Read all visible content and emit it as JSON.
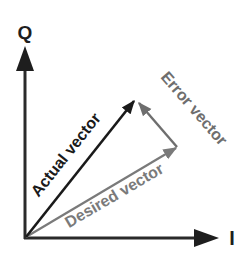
{
  "diagram": {
    "axes": {
      "q_label": "Q",
      "i_label": "I"
    },
    "vectors": {
      "actual": {
        "label": "Actual vector",
        "color": "#1a1a1a"
      },
      "desired": {
        "label": "Desired vector",
        "color": "#7a7a7a"
      },
      "error": {
        "label": "Error vector",
        "color": "#6e6e6e"
      }
    },
    "colors": {
      "axis": "#2a2a2a",
      "background": "#ffffff"
    }
  }
}
